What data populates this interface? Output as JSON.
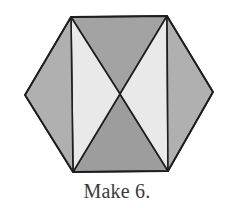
{
  "diagram": {
    "caption": "Make 6.",
    "vertices": {
      "top_left": [
        71,
        17
      ],
      "top_right": [
        167,
        16
      ],
      "right": [
        213,
        92
      ],
      "bottom_right": [
        168,
        171
      ],
      "bottom_left": [
        73,
        172
      ],
      "left": [
        25,
        95
      ],
      "center": [
        120,
        94
      ]
    },
    "triangles": [
      {
        "name": "top",
        "points": "71,17 167,16 120,94",
        "fill": "#a3a3a3"
      },
      {
        "name": "bottom",
        "points": "73,172 168,171 120,94",
        "fill": "#9d9d9d"
      },
      {
        "name": "inner-left",
        "points": "71,17 120,94 73,172",
        "fill": "#e9e9e9"
      },
      {
        "name": "inner-right",
        "points": "167,16 120,94 168,171",
        "fill": "#e9e9e9"
      },
      {
        "name": "outer-left",
        "points": "71,17 25,95 73,172",
        "fill": "#b0b0b0"
      },
      {
        "name": "outer-right",
        "points": "167,16 213,92 168,171",
        "fill": "#b0b0b0"
      }
    ],
    "stroke_color": "#1e1e1e"
  }
}
